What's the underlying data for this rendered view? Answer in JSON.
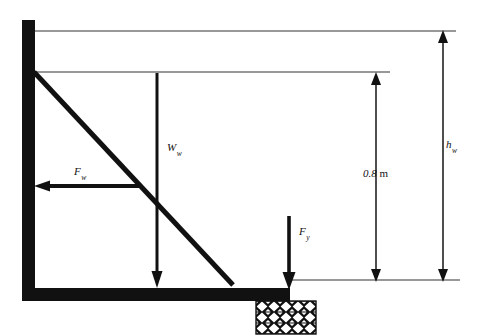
{
  "figure": {
    "type": "free-body-diagram",
    "background_color": "#ffffff",
    "stroke_color": "#111111"
  },
  "labels": {
    "force_water": {
      "symbol": "F",
      "subscript": "w"
    },
    "weight_wall": {
      "symbol": "W",
      "subscript": "w"
    },
    "force_vertical": {
      "symbol": "F",
      "subscript": "y"
    },
    "dimension_inner": {
      "value": "0.8",
      "unit": "m"
    },
    "dimension_outer": {
      "symbol": "h",
      "subscript": "w"
    }
  },
  "geometry": {
    "wall": {
      "x": 22,
      "y": 20,
      "width": 13,
      "height": 281
    },
    "base": {
      "x": 22,
      "y": 288,
      "width": 268,
      "height": 13
    },
    "diagonal": {
      "x1": 34,
      "y1": 72,
      "x2": 233,
      "y2": 285
    },
    "block": {
      "x": 256,
      "y": 301,
      "width": 60,
      "height": 33
    }
  },
  "reference_lines": [
    {
      "name": "top-water-surface-line",
      "x1": 34,
      "y1": 31,
      "x2": 456,
      "y2": 31
    },
    {
      "name": "wall-top-line",
      "x1": 34,
      "y1": 72,
      "x2": 390,
      "y2": 72
    },
    {
      "name": "base-level-line",
      "x1": 288,
      "y1": 280,
      "x2": 460,
      "y2": 280
    }
  ],
  "arrows": [
    {
      "name": "force-water-arrow",
      "direction": "left",
      "x1": 138,
      "y1": 186,
      "x2": 36,
      "y2": 186,
      "double_headed": false
    },
    {
      "name": "weight-wall-arrow",
      "direction": "down",
      "x1": 157,
      "y1": 73,
      "x2": 157,
      "y2": 286,
      "double_headed": false
    },
    {
      "name": "force-vertical-arrow",
      "direction": "down",
      "x1": 289,
      "y1": 216,
      "x2": 289,
      "y2": 288,
      "double_headed": false
    },
    {
      "name": "dimension-inner-arrow",
      "direction": "vertical",
      "x1": 376,
      "y1": 74,
      "x2": 376,
      "y2": 280,
      "double_headed": true
    },
    {
      "name": "dimension-outer-arrow",
      "direction": "vertical",
      "x1": 443,
      "y1": 31,
      "x2": 443,
      "y2": 280,
      "double_headed": true
    }
  ],
  "block_pattern": {
    "name": "checkerboard-diamond",
    "columns": 5,
    "rows": 3,
    "fill": "#111111",
    "diamond_fill": "#ffffff"
  }
}
